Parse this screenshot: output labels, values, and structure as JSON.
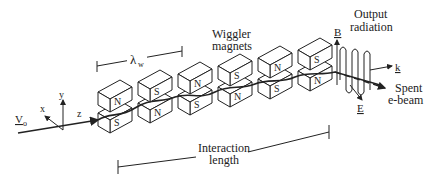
{
  "diagram": {
    "labels": {
      "lambda_w": "λ",
      "lambda_sub": "w",
      "wiggler_line1": "Wiggler",
      "wiggler_line2": "magnets",
      "output_line1": "Output",
      "output_line2": "radiation",
      "B": "B",
      "k": "k",
      "E": "E",
      "spent_line1": "Spent",
      "spent_line2": "e-beam",
      "interaction_line1": "Interaction",
      "interaction_line2": "length",
      "V": "V",
      "V_sub": "o",
      "axis_x": "x",
      "axis_y": "y",
      "axis_z": "z"
    },
    "magnet_pairs": [
      {
        "top": "N",
        "bottom": "S"
      },
      {
        "top": "S",
        "bottom": "N"
      },
      {
        "top": "N",
        "bottom": "S"
      },
      {
        "top": "S",
        "bottom": "N"
      },
      {
        "top": "N",
        "bottom": "S"
      },
      {
        "top": "S",
        "bottom": "N"
      }
    ],
    "colors": {
      "ink": "#222222",
      "background": "#ffffff"
    }
  }
}
